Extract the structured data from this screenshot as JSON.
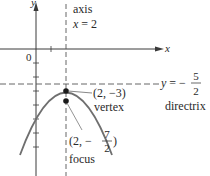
{
  "diagram": {
    "colors": {
      "axes": "#3a3a3a",
      "curve": "#6f6f6f",
      "dashed": "#555555",
      "text": "#2a2a2a"
    },
    "axes": {
      "x_label": "x",
      "y_label": "y",
      "origin_label": "0"
    },
    "axis_of_symmetry": {
      "label_line1": "axis",
      "label_line2_var": "x",
      "label_line2_eq": " = 2"
    },
    "directrix": {
      "eq_var": "y",
      "eq_sign": " = −",
      "frac_num": "5",
      "frac_den": "2",
      "label": "directrix"
    },
    "vertex": {
      "coord": "(2, −3)",
      "label": "vertex"
    },
    "focus": {
      "coord_prefix": "(2, −",
      "frac_num": "7",
      "frac_den": "2",
      "coord_suffix": ")",
      "label": "focus"
    }
  }
}
